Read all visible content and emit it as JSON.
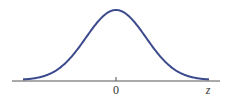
{
  "chart_data": {
    "type": "line",
    "title": "",
    "xlabel": "z",
    "ylabel": "",
    "x_tick_labels": [
      "0"
    ],
    "series": [
      {
        "name": "normal density",
        "color": "#3b4a8c",
        "x": [
          -3,
          -2,
          -1,
          0,
          1,
          2,
          3
        ],
        "values": [
          0.004,
          0.054,
          0.242,
          0.399,
          0.242,
          0.054,
          0.004
        ]
      }
    ],
    "grid": false
  },
  "labels": {
    "zero": "0",
    "axis": "z"
  },
  "colors": {
    "curve": "#3b4a8c",
    "axis": "#555555"
  }
}
